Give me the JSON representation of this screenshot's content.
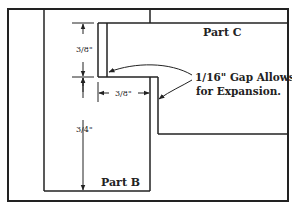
{
  "diagram": {
    "parts": {
      "part_b": "Part B",
      "part_c": "Part C"
    },
    "dimensions": {
      "upper_vertical": "3/8\"",
      "lower_vertical": "3/4\"",
      "horizontal": "3/8\""
    },
    "note": {
      "line1": "1/16\" Gap Allows",
      "line2": "for Expansion."
    },
    "colors": {
      "line": "#222222",
      "background": "#ffffff"
    }
  }
}
